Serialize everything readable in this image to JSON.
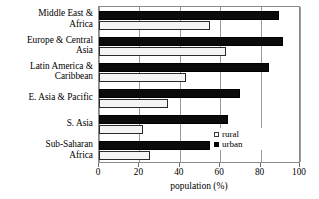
{
  "chart_data": {
    "type": "bar",
    "orientation": "horizontal",
    "title": "",
    "xlabel": "population (%)",
    "ylabel": "",
    "xlim": [
      0,
      100
    ],
    "xticks": [
      0,
      20,
      40,
      60,
      80,
      100
    ],
    "xticklabels": [
      "0",
      "20",
      "40",
      "60",
      "80",
      "100"
    ],
    "grid": "vertical",
    "legend_position": "inside-lower-right",
    "categories": [
      "Middle East &\nAfrica",
      "Europe & Central\nAsia",
      "Latin America &\nCaribbean",
      "E. Asia & Pacific",
      "S. Asia",
      "Sub-Saharan\nAfrica"
    ],
    "series": [
      {
        "name": "rural",
        "color": "#f4f4f4",
        "edge_color": "#2a2a2a",
        "values": [
          55,
          63,
          43,
          34,
          22,
          25
        ]
      },
      {
        "name": "urban",
        "color": "#000000",
        "edge_color": "#000000",
        "values": [
          89,
          91,
          84,
          70,
          64,
          55
        ]
      }
    ]
  },
  "legend": {
    "entries": [
      {
        "label": "rural"
      },
      {
        "label": "urban"
      }
    ]
  },
  "axis": {
    "xlabel": "population (%)"
  }
}
